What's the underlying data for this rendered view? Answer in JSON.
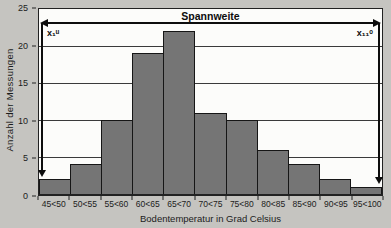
{
  "chart_data": {
    "type": "bar",
    "chart_kind": "histogram",
    "title": "Spannweite",
    "categories": [
      "45<50",
      "50<55",
      "55<60",
      "60<65",
      "65<70",
      "70<75",
      "75<80",
      "80<85",
      "85<90",
      "90<95",
      "95<100"
    ],
    "values": [
      2,
      4,
      10,
      19,
      22,
      11,
      10,
      6,
      4,
      2,
      1
    ],
    "xlabel": "Bodentemperatur in Grad Celsius",
    "ylabel": "Anzahl der Messungen",
    "ylim": [
      0,
      25
    ],
    "yticks": [
      0,
      5,
      10,
      15,
      20,
      25
    ],
    "grid": "horizontal",
    "legend": "none",
    "annotations": {
      "range_label": "Spannweite",
      "left_bound": "x₁ᵘ",
      "right_bound": "x₁₁ᵒ"
    },
    "colors": {
      "bar_fill": "#757575",
      "bar_border": "#161616",
      "plot_bg": "#fcfcfa",
      "page_bg": "#c5c4c0",
      "line": "#0d0d0d"
    }
  }
}
